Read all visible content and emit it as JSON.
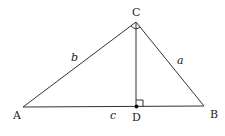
{
  "diagram": {
    "type": "right-triangle-with-altitude",
    "vertices": {
      "A": {
        "label": "A"
      },
      "B": {
        "label": "B"
      },
      "C": {
        "label": "C"
      },
      "D": {
        "label": "D"
      }
    },
    "sides": {
      "a": {
        "label": "a"
      },
      "b": {
        "label": "b"
      },
      "c": {
        "label": "c"
      }
    },
    "line_color": "#333333"
  }
}
